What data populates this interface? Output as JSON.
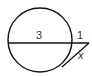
{
  "diagram": {
    "type": "circle-secant-tangent",
    "stroke_color": "#111111",
    "background": "#ffffff",
    "labels": {
      "internal_segment": "3",
      "external_segment": "1",
      "tangent_segment": "x"
    }
  }
}
